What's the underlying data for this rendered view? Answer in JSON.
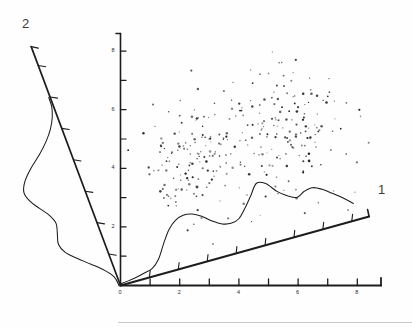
{
  "figure": {
    "title": "",
    "background_color": "#fefefe",
    "ink_color": "#1d1d1d",
    "axis_labels": {
      "projection_1": "1",
      "projection_2": "2"
    },
    "origin_label": "0"
  },
  "chart_data": {
    "type": "scatter",
    "title": "",
    "xlabel": "1",
    "ylabel": "2",
    "grid": false,
    "legend": null,
    "vertical_axis": {
      "name": "vertical-reference-axis",
      "ticks": [
        1,
        2,
        3,
        4,
        5,
        6,
        7,
        8
      ],
      "labeled_ticks": [
        2,
        4,
        6,
        8
      ],
      "tick_labels": [
        "2",
        "4",
        "6",
        "8"
      ],
      "range": [
        0,
        8.6
      ]
    },
    "horizontal_axis": {
      "name": "axis-projection-1-baseline",
      "ticks": [
        0,
        1,
        2,
        3,
        4,
        5,
        6,
        7,
        8
      ],
      "labeled_ticks": [
        0,
        2,
        4,
        6,
        8
      ],
      "tick_labels": [
        "0",
        "2",
        "4",
        "6",
        "8"
      ],
      "range": [
        0,
        8.8
      ]
    },
    "projection_axis_1": {
      "label": "1",
      "ticks": [
        1,
        2,
        3,
        4,
        5,
        6,
        7,
        8
      ],
      "direction_deg": -15.5
    },
    "projection_axis_2": {
      "label": "2",
      "ticks": [
        1,
        2,
        3,
        4,
        5,
        6,
        7
      ],
      "direction_deg": -110.5
    },
    "density_1": {
      "name": "marginal-density-projection-1",
      "modality": "bimodal",
      "x": [
        0.0,
        0.3,
        0.6,
        0.9,
        1.2,
        1.5,
        1.8,
        2.1,
        2.4,
        2.7,
        3.0,
        3.3,
        3.6,
        3.9,
        4.2,
        4.5,
        4.8,
        5.1,
        5.4,
        5.7,
        6.0,
        6.3,
        6.6,
        6.9,
        7.2,
        7.5,
        7.8,
        8.1,
        8.4
      ],
      "y": [
        0.02,
        0.03,
        0.05,
        0.08,
        0.14,
        0.26,
        0.46,
        0.66,
        0.78,
        0.82,
        0.8,
        0.72,
        0.6,
        0.52,
        0.5,
        0.54,
        0.66,
        0.84,
        1.0,
        0.96,
        0.8,
        0.68,
        0.62,
        0.66,
        0.7,
        0.62,
        0.52,
        0.4,
        0.28
      ]
    },
    "density_2": {
      "name": "marginal-density-projection-2",
      "modality": "unimodal-skewed",
      "x": [
        0.0,
        0.3,
        0.6,
        0.9,
        1.2,
        1.5,
        1.8,
        2.1,
        2.4,
        2.7,
        3.0,
        3.3,
        3.6,
        3.9,
        4.2,
        4.5,
        4.8,
        5.1,
        5.4,
        5.7,
        6.0
      ],
      "y": [
        0.02,
        0.06,
        0.18,
        0.36,
        0.54,
        0.68,
        0.74,
        0.7,
        0.66,
        0.72,
        0.84,
        0.96,
        1.0,
        0.92,
        0.74,
        0.52,
        0.32,
        0.18,
        0.09,
        0.04,
        0.01
      ]
    },
    "clusters": [
      {
        "name": "cluster-left",
        "center_x": 2.55,
        "center_y": 4.35,
        "n_points": 150,
        "spread_x": 0.95,
        "spread_y": 0.95
      },
      {
        "name": "cluster-right",
        "center_x": 5.45,
        "center_y": 5.25,
        "n_points": 170,
        "spread_x": 1.05,
        "spread_y": 1.05
      }
    ]
  }
}
